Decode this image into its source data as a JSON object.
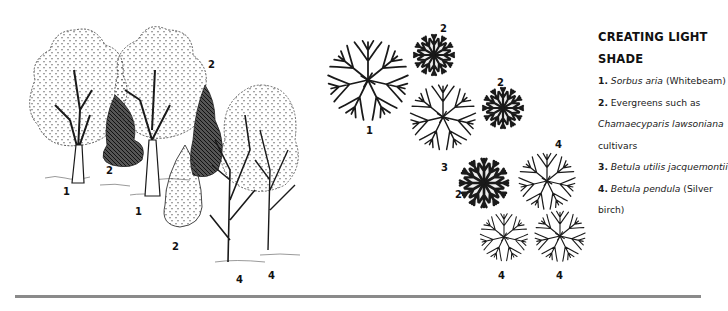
{
  "caption": {
    "title_line1": "CREATING LIGHT",
    "title_line2": "SHADE",
    "items": [
      {
        "num": "1.",
        "italic": "Sorbus aria",
        "plain": " (Whitebeam)"
      },
      {
        "num": "2.",
        "plain": " Evergreens such as"
      },
      {
        "italic": "Chamaecyparis lawsoniana"
      },
      {
        "plain": "cultivars"
      },
      {
        "num": "3.",
        "italic": "Betula utilis jacquemontii"
      },
      {
        "num": "4.",
        "italic": "Betula pendula",
        "plain": " (Silver"
      },
      {
        "plain": "birch)"
      }
    ]
  },
  "elevation_labels": [
    {
      "text": "1",
      "x": 63,
      "y": 187
    },
    {
      "text": "2",
      "x": 106,
      "y": 166
    },
    {
      "text": "1",
      "x": 135,
      "y": 207
    },
    {
      "text": "2",
      "x": 208,
      "y": 60
    },
    {
      "text": "2",
      "x": 172,
      "y": 242
    },
    {
      "text": "4",
      "x": 236,
      "y": 275
    },
    {
      "text": "4",
      "x": 268,
      "y": 271
    }
  ],
  "plan_labels": [
    {
      "text": "2",
      "x": 440,
      "y": 24
    },
    {
      "text": "1",
      "x": 366,
      "y": 126
    },
    {
      "text": "2",
      "x": 497,
      "y": 78
    },
    {
      "text": "3",
      "x": 441,
      "y": 163
    },
    {
      "text": "2",
      "x": 455,
      "y": 190
    },
    {
      "text": "4",
      "x": 555,
      "y": 140
    },
    {
      "text": "4",
      "x": 498,
      "y": 271
    },
    {
      "text": "4",
      "x": 556,
      "y": 271
    }
  ],
  "colors": {
    "ink": "#1a1a1a",
    "rule": "#8a8a8a"
  }
}
